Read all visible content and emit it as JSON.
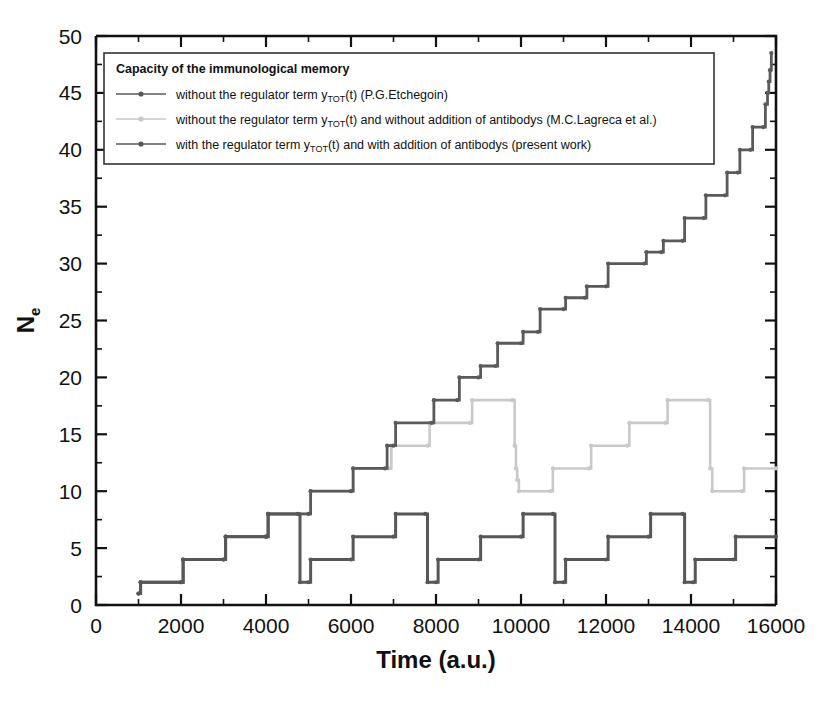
{
  "chart_data": {
    "type": "line",
    "title": "",
    "xlabel": "Time (a.u.)",
    "ylabel": "N_e",
    "ylabel_main": "N",
    "ylabel_subscript": "e",
    "xlim": [
      0,
      16000
    ],
    "ylim": [
      0,
      50
    ],
    "grid": false,
    "x_major_ticks": [
      0,
      2000,
      4000,
      6000,
      8000,
      10000,
      12000,
      14000,
      16000
    ],
    "x_minor_step": 1000,
    "y_major_ticks": [
      0,
      5,
      10,
      15,
      20,
      25,
      30,
      35,
      40,
      45,
      50
    ],
    "y_minor_step": 2.5,
    "x_tick_labels": [
      "0",
      "2000",
      "4000",
      "6000",
      "8000",
      "10000",
      "12000",
      "14000",
      "16000"
    ],
    "y_tick_labels": [
      "0",
      "5",
      "10",
      "15",
      "20",
      "25",
      "30",
      "35",
      "40",
      "45",
      "50"
    ],
    "legend": {
      "position": "top-left-inside",
      "title": "Capacity of the immunological memory",
      "entries": [
        {
          "id": "etchegoin",
          "label_pre": "without the regulator term  y",
          "label_sub": "TOT",
          "label_post": "(t) (P.G.Etchegoin)",
          "color": "#5a5a5a",
          "width": 1.6
        },
        {
          "id": "lagreca",
          "label_pre": "without the regulator term  y",
          "label_sub": "TOT",
          "label_post": "(t) and without addition of antibodys  (M.C.Lagreca et al.)",
          "color": "#c9c9c9",
          "width": 1.6
        },
        {
          "id": "present-work",
          "label_pre": "with the regulator term  y",
          "label_sub": "TOT",
          "label_post": "(t) and with addition of antibodys (present work)",
          "color": "#575757",
          "width": 2.4
        }
      ]
    },
    "series": [
      {
        "name": "without the regulator term yTOT(t) (P.G.Etchegoin)",
        "id": "etchegoin",
        "color": "#5a5a5a",
        "style": "step",
        "points": [
          [
            1000,
            1
          ],
          [
            1050,
            2
          ],
          [
            2000,
            2
          ],
          [
            2050,
            4
          ],
          [
            3000,
            4
          ],
          [
            3050,
            6
          ],
          [
            4000,
            6
          ],
          [
            4050,
            8
          ],
          [
            5000,
            8
          ],
          [
            5050,
            10
          ],
          [
            6000,
            10
          ],
          [
            6050,
            12
          ],
          [
            6800,
            12
          ],
          [
            6850,
            14
          ],
          [
            7000,
            14
          ],
          [
            7050,
            16
          ],
          [
            7900,
            16
          ],
          [
            7950,
            18
          ],
          [
            8500,
            18
          ],
          [
            8550,
            20
          ],
          [
            9000,
            20
          ],
          [
            9050,
            21
          ],
          [
            9400,
            21
          ],
          [
            9450,
            23
          ],
          [
            10000,
            23
          ],
          [
            10050,
            24
          ],
          [
            10400,
            24
          ],
          [
            10450,
            26
          ],
          [
            11000,
            26
          ],
          [
            11050,
            27
          ],
          [
            11500,
            27
          ],
          [
            11550,
            28
          ],
          [
            12000,
            28
          ],
          [
            12050,
            30
          ],
          [
            12900,
            30
          ],
          [
            12950,
            31
          ],
          [
            13300,
            31
          ],
          [
            13350,
            32
          ],
          [
            13800,
            32
          ],
          [
            13850,
            34
          ],
          [
            14300,
            34
          ],
          [
            14350,
            36
          ],
          [
            14800,
            36
          ],
          [
            14850,
            38
          ],
          [
            15100,
            38
          ],
          [
            15150,
            40
          ],
          [
            15400,
            40
          ],
          [
            15450,
            42
          ],
          [
            15700,
            42
          ],
          [
            15750,
            44
          ],
          [
            15800,
            45
          ],
          [
            15830,
            46
          ],
          [
            15860,
            47
          ],
          [
            15890,
            48.5
          ]
        ]
      },
      {
        "name": "without the regulator term yTOT(t) and without addition of antibodys (M.C.Lagreca et al.)",
        "id": "lagreca",
        "color": "#c9c9c9",
        "style": "step",
        "points": [
          [
            1000,
            1
          ],
          [
            1050,
            2
          ],
          [
            2000,
            2
          ],
          [
            2050,
            4
          ],
          [
            3000,
            4
          ],
          [
            3050,
            6
          ],
          [
            4000,
            6
          ],
          [
            4050,
            8
          ],
          [
            5000,
            8
          ],
          [
            5050,
            10
          ],
          [
            6000,
            10
          ],
          [
            6050,
            12
          ],
          [
            6900,
            12
          ],
          [
            6950,
            14
          ],
          [
            7800,
            14
          ],
          [
            7850,
            16
          ],
          [
            8800,
            16
          ],
          [
            8850,
            18
          ],
          [
            9800,
            18
          ],
          [
            9850,
            14
          ],
          [
            9880,
            12
          ],
          [
            9910,
            11
          ],
          [
            9950,
            10
          ],
          [
            10700,
            10
          ],
          [
            10750,
            12
          ],
          [
            11600,
            12
          ],
          [
            11650,
            14
          ],
          [
            12500,
            14
          ],
          [
            12550,
            16
          ],
          [
            13400,
            16
          ],
          [
            13450,
            18
          ],
          [
            14400,
            18
          ],
          [
            14450,
            12
          ],
          [
            14500,
            10
          ],
          [
            15200,
            10
          ],
          [
            15250,
            12
          ],
          [
            16000,
            12
          ]
        ]
      },
      {
        "name": "with the regulator term yTOT(t) and with addition of antibodys (present work)",
        "id": "present-work",
        "color": "#575757",
        "style": "step",
        "points": [
          [
            1000,
            1
          ],
          [
            1050,
            2
          ],
          [
            2000,
            2
          ],
          [
            2050,
            4
          ],
          [
            3000,
            4
          ],
          [
            3050,
            6
          ],
          [
            4000,
            6
          ],
          [
            4050,
            8
          ],
          [
            4750,
            8
          ],
          [
            4800,
            2
          ],
          [
            5000,
            2
          ],
          [
            5050,
            4
          ],
          [
            6000,
            4
          ],
          [
            6050,
            6
          ],
          [
            7000,
            6
          ],
          [
            7050,
            8
          ],
          [
            7750,
            8
          ],
          [
            7800,
            2
          ],
          [
            8000,
            2
          ],
          [
            8050,
            4
          ],
          [
            9000,
            4
          ],
          [
            9050,
            6
          ],
          [
            10000,
            6
          ],
          [
            10050,
            8
          ],
          [
            10750,
            8
          ],
          [
            10800,
            2
          ],
          [
            11000,
            2
          ],
          [
            11050,
            4
          ],
          [
            12000,
            4
          ],
          [
            12050,
            6
          ],
          [
            13000,
            6
          ],
          [
            13050,
            8
          ],
          [
            13800,
            8
          ],
          [
            13850,
            2
          ],
          [
            14050,
            2
          ],
          [
            14100,
            4
          ],
          [
            15000,
            4
          ],
          [
            15050,
            6
          ],
          [
            16000,
            6
          ]
        ]
      }
    ],
    "colors": {
      "axis": "#111111",
      "background": "#ffffff",
      "etchegoin": "#5a5a5a",
      "lagreca": "#c9c9c9",
      "present_work": "#575757"
    }
  }
}
